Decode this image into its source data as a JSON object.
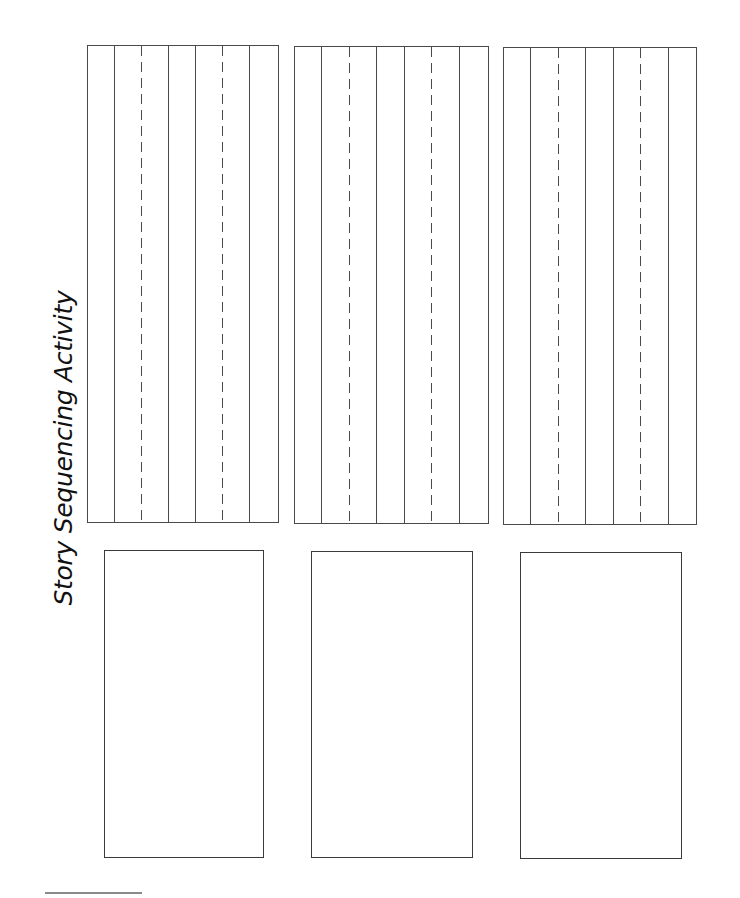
{
  "page": {
    "title": "Story Sequencing Activity",
    "line_color": "#4a4a4a",
    "background_color": "#ffffff"
  },
  "panels": [
    {
      "index": 1,
      "writing_box": {
        "left": 87,
        "top": 45,
        "right": 279,
        "bottom": 523
      },
      "rules": [
        {
          "x": 114,
          "style": "solid"
        },
        {
          "x": 141,
          "style": "dashed"
        },
        {
          "x": 168,
          "style": "solid"
        },
        {
          "x": 195,
          "style": "solid"
        },
        {
          "x": 222,
          "style": "dashed"
        },
        {
          "x": 249,
          "style": "solid"
        }
      ],
      "picture_box": {
        "left": 104,
        "top": 550,
        "right": 264,
        "bottom": 858
      }
    },
    {
      "index": 2,
      "writing_box": {
        "left": 294,
        "top": 46,
        "right": 489,
        "bottom": 524
      },
      "rules": [
        {
          "x": 321,
          "style": "solid"
        },
        {
          "x": 349,
          "style": "dashed"
        },
        {
          "x": 376,
          "style": "solid"
        },
        {
          "x": 404,
          "style": "solid"
        },
        {
          "x": 431,
          "style": "dashed"
        },
        {
          "x": 459,
          "style": "solid"
        }
      ],
      "picture_box": {
        "left": 311,
        "top": 551,
        "right": 473,
        "bottom": 858
      }
    },
    {
      "index": 3,
      "writing_box": {
        "left": 503,
        "top": 47,
        "right": 697,
        "bottom": 525
      },
      "rules": [
        {
          "x": 530,
          "style": "solid"
        },
        {
          "x": 558,
          "style": "dashed"
        },
        {
          "x": 585,
          "style": "solid"
        },
        {
          "x": 613,
          "style": "solid"
        },
        {
          "x": 640,
          "style": "dashed"
        },
        {
          "x": 668,
          "style": "solid"
        }
      ],
      "picture_box": {
        "left": 520,
        "top": 552,
        "right": 682,
        "bottom": 859
      }
    }
  ],
  "footnote": {
    "rule_visible": true
  }
}
